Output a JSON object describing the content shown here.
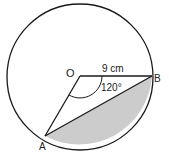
{
  "diagram": {
    "type": "circle-segment",
    "center_label": "O",
    "point_a_label": "A",
    "point_b_label": "B",
    "radius_label": "9 cm",
    "angle_label": "120°",
    "colors": {
      "stroke": "#1a1a1a",
      "shaded_segment": "#cccccc",
      "background": "#ffffff"
    }
  }
}
